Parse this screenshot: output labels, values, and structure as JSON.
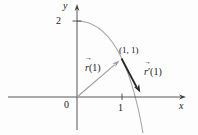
{
  "figure": {
    "background": "#fdfdfd",
    "labels": {
      "y_axis": "y",
      "x_axis": "x",
      "origin": "0",
      "x_tick": "1",
      "y_tick": "2",
      "point": "(1, 1)"
    },
    "position_vector": {
      "letter": "r",
      "over_arrow": "→",
      "argument": "(1)"
    },
    "tangent_vector": {
      "letter": "r",
      "over_arrow": "→",
      "prime": "′",
      "argument": "(1)"
    },
    "colors": {
      "axis": "#444444",
      "text": "#1a1a1a",
      "curve": "#a6a6a6",
      "position_vector": "#a0a0a0",
      "tangent_vector": "#262626"
    }
  }
}
